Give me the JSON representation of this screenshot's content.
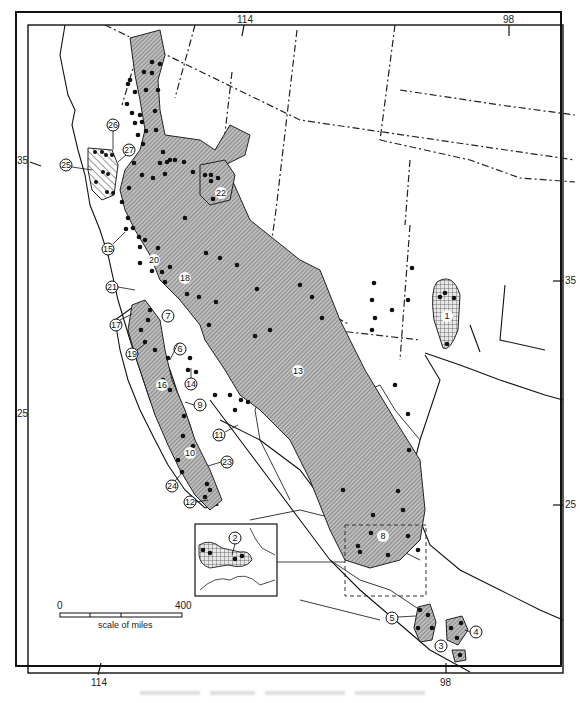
{
  "figure": {
    "type": "range distribution map",
    "region": "Southwestern United States and Mexico"
  },
  "graticule": {
    "longitude_top": [
      "114",
      "98"
    ],
    "longitude_bottom": [
      "114",
      "98"
    ],
    "latitude_left": [
      "35",
      "25"
    ],
    "latitude_right": [
      "35",
      "25"
    ]
  },
  "scale_bar": {
    "start_label": "0",
    "end_label": "400",
    "unit_label": "scale of miles"
  },
  "range_labels": [
    "1",
    "2",
    "3",
    "4",
    "5",
    "6",
    "7",
    "8",
    "9",
    "10",
    "11",
    "12",
    "13",
    "14",
    "15",
    "16",
    "17",
    "18",
    "19",
    "20",
    "21",
    "22",
    "23",
    "24",
    "25",
    "26",
    "27"
  ],
  "inset": {
    "label": "2",
    "pattern": "crosshatch"
  },
  "legend_patterns": {
    "stipple_gray": "#9a9a9a",
    "diagonal_hatch": "#777777",
    "crosshatch": "#888888",
    "record_dot": "#111111"
  },
  "colors": {
    "ink": "#111111",
    "range_fill": "#a8a8a8",
    "paper": "#ffffff"
  }
}
